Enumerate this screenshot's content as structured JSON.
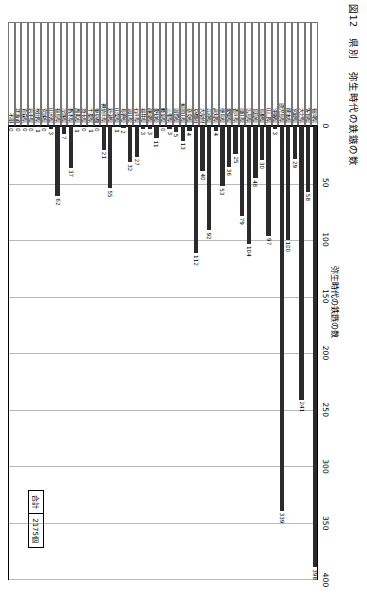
{
  "figure": {
    "number": "図12",
    "category": "県別",
    "title": "弥生時代の鉄鏃の数"
  },
  "axis": {
    "title": "弥生時代の鉄鏃の数",
    "ticks": [
      "0",
      "50",
      "100",
      "150",
      "200",
      "250",
      "300",
      "350",
      "400"
    ]
  },
  "total": {
    "label": "合計",
    "value": "2175個"
  },
  "chart_data": {
    "type": "bar",
    "orientation": "horizontal",
    "title": "図12 県別 弥生時代の鉄鏃の数",
    "xlabel": "弥生時代の鉄鏃の数",
    "ylabel": "県別",
    "xlim": [
      0,
      400
    ],
    "grid": true,
    "legend": "合計 2175個",
    "categories": [
      "福岡県",
      "佐賀県",
      "大分県",
      "宮崎県",
      "熊本県",
      "鹿児島県",
      "沖縄県",
      "山口県",
      "島根県",
      "鳥取県",
      "広島県",
      "岡山県",
      "香川県",
      "愛媛県",
      "徳島県",
      "高知県",
      "兵庫県",
      "大阪府",
      "京都府",
      "奈良県",
      "和歌山県",
      "滋賀県",
      "三重県",
      "岐阜県",
      "愛知県",
      "静岡県",
      "福井県",
      "石川県",
      "富山県",
      "長野県",
      "山梨県",
      "新潟県",
      "神奈川県",
      "東京都",
      "千葉県",
      "埼玉県",
      "群馬県",
      "栃木県",
      "茨城県",
      "福島県",
      "山形県",
      "宮城県",
      "秋田県",
      "岩手県",
      "青森県",
      "北海道",
      "不明"
    ],
    "values": [
      398,
      58,
      241,
      29,
      100,
      339,
      3,
      97,
      30,
      46,
      104,
      79,
      25,
      36,
      53,
      4,
      92,
      40,
      112,
      4,
      13,
      5,
      3,
      0,
      11,
      3,
      3,
      27,
      32,
      2,
      1,
      55,
      21,
      0,
      1,
      0,
      1,
      37,
      7,
      62,
      3,
      0,
      1,
      0,
      0,
      0,
      0
    ]
  }
}
